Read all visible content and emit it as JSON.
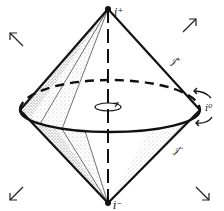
{
  "diagram": {
    "labels": {
      "i_plus": "i⁺",
      "i_minus": "i⁻",
      "i_zero": "i⁰",
      "scri_plus": "𝒥⁺",
      "scri_minus": "𝒥⁻"
    },
    "colors": {
      "ink": "#111111",
      "background": "#ffffff",
      "stipple": "#555555"
    }
  }
}
